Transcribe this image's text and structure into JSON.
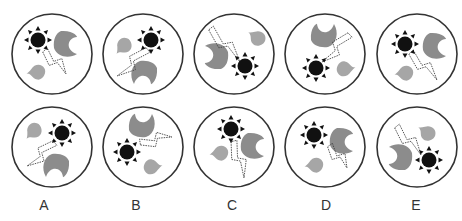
{
  "puzzle": {
    "description": "Figure sequence puzzle: top row shows 5 circles with sun, crescent moon, droplet and lightning; bottom row shows answer options A-E",
    "colors": {
      "outline": "#333333",
      "sun": "#111111",
      "moon": "#8c8c8c",
      "drop": "#a6a6a6",
      "bolt": "#444444",
      "background": "#ffffff"
    },
    "top_row": [
      {
        "cx": 52,
        "cy": 54,
        "sun": [
          38,
          40
        ],
        "moon": [
          63,
          44,
          0
        ],
        "drop": [
          37,
          71,
          200
        ],
        "bolt": [
          [
            45,
            50
          ],
          [
            66,
            74
          ]
        ]
      },
      {
        "cx": 143,
        "cy": 54,
        "sun": [
          151,
          40
        ],
        "moon": [
          144,
          70,
          90
        ],
        "drop": [
          123,
          45,
          160
        ],
        "bolt": [
          [
            148,
            50
          ],
          [
            117,
            76
          ]
        ]
      },
      {
        "cx": 234,
        "cy": 54,
        "sun": [
          245,
          66
        ],
        "moon": [
          219,
          56,
          180
        ],
        "drop": [
          258,
          37,
          240
        ],
        "bolt": [
          [
            211,
            28
          ],
          [
            240,
            62
          ]
        ]
      },
      {
        "cx": 325,
        "cy": 54,
        "sun": [
          316,
          68
        ],
        "moon": [
          324,
          38,
          270
        ],
        "drop": [
          345,
          70,
          20
        ],
        "bolt": [
          [
            350,
            35
          ],
          [
            322,
            62
          ]
        ]
      },
      {
        "cx": 417,
        "cy": 54,
        "sun": [
          405,
          44
        ],
        "moon": [
          432,
          46,
          0
        ],
        "drop": [
          405,
          72,
          200
        ],
        "bolt": [
          [
            411,
            52
          ],
          [
            437,
            80
          ]
        ]
      }
    ],
    "options": [
      {
        "label": "A",
        "cx": 52,
        "cy": 147,
        "sun": [
          62,
          133
        ],
        "moon": [
          56,
          163,
          90
        ],
        "drop": [
          33,
          130,
          160
        ],
        "bolt": [
          [
            55,
            143
          ],
          [
            27,
            166
          ]
        ]
      },
      {
        "label": "B",
        "cx": 143,
        "cy": 147,
        "sun": [
          127,
          152
        ],
        "moon": [
          142,
          128,
          270
        ],
        "drop": [
          152,
          168,
          20
        ],
        "bolt": [
          [
            140,
            142
          ],
          [
            172,
            137
          ]
        ]
      },
      {
        "label": "C",
        "cx": 234,
        "cy": 147,
        "sun": [
          231,
          129
        ],
        "moon": [
          250,
          146,
          0
        ],
        "drop": [
          220,
          152,
          200
        ],
        "bolt": [
          [
            234,
            141
          ],
          [
            244,
            178
          ]
        ]
      },
      {
        "label": "D",
        "cx": 325,
        "cy": 147,
        "sun": [
          314,
          135
        ],
        "moon": [
          339,
          141,
          0
        ],
        "drop": [
          315,
          164,
          200
        ],
        "bolt": [
          [
            330,
            145
          ],
          [
            347,
            168
          ]
        ]
      },
      {
        "label": "E",
        "cx": 417,
        "cy": 147,
        "sun": [
          429,
          160
        ],
        "moon": [
          403,
          157,
          180
        ],
        "drop": [
          428,
          132,
          240
        ],
        "bolt": [
          [
            397,
            126
          ],
          [
            421,
            155
          ]
        ]
      }
    ],
    "labels": [
      "A",
      "B",
      "C",
      "D",
      "E"
    ],
    "label_positions": [
      44,
      136,
      232,
      326,
      416
    ]
  }
}
